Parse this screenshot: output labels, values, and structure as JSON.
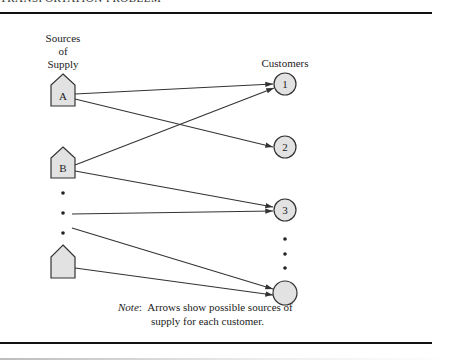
{
  "header": {
    "partial_title": "TRANSPORTATION PROBLEM"
  },
  "diagram": {
    "sources_title_lines": [
      "Sources",
      "of",
      "Supply"
    ],
    "customers_title": "Customers",
    "colors": {
      "node_fill": "#e2e2e2",
      "node_stroke": "#333333",
      "arrow": "#333333",
      "rule": "#111111"
    },
    "sources": [
      {
        "id": "A",
        "label": "A",
        "cx": 63,
        "top": 74,
        "shoulder": 85,
        "base": 106
      },
      {
        "id": "B",
        "label": "B",
        "cx": 63,
        "top": 147,
        "shoulder": 158,
        "base": 178
      },
      {
        "id": "N",
        "label": "",
        "cx": 63,
        "top": 245,
        "shoulder": 257,
        "base": 278
      }
    ],
    "source_ellipsis_dots": [
      {
        "x": 63,
        "y": 193
      },
      {
        "x": 63,
        "y": 213
      },
      {
        "x": 63,
        "y": 233
      }
    ],
    "customers": [
      {
        "id": "1",
        "label": "1",
        "cx": 285,
        "cy": 84,
        "r": 11
      },
      {
        "id": "2",
        "label": "2",
        "cx": 285,
        "cy": 147,
        "r": 11
      },
      {
        "id": "3",
        "label": "3",
        "cx": 285,
        "cy": 210,
        "r": 11
      },
      {
        "id": "N",
        "label": "",
        "cx": 285,
        "cy": 293,
        "r": 12
      }
    ],
    "customer_ellipsis_dots": [
      {
        "x": 285,
        "y": 239
      },
      {
        "x": 285,
        "y": 254
      },
      {
        "x": 285,
        "y": 268
      }
    ],
    "arrows": [
      {
        "from": "A",
        "to": "1",
        "x1": 75,
        "y1": 94,
        "x2": 273,
        "y2": 84
      },
      {
        "from": "A",
        "to": "2",
        "x1": 75,
        "y1": 99,
        "x2": 273,
        "y2": 147
      },
      {
        "from": "B",
        "to": "1",
        "x1": 75,
        "y1": 165,
        "x2": 274,
        "y2": 88
      },
      {
        "from": "B",
        "to": "3",
        "x1": 75,
        "y1": 171,
        "x2": 273,
        "y2": 207
      },
      {
        "from": "dots",
        "to": "3",
        "x1": 72,
        "y1": 214,
        "x2": 273,
        "y2": 211
      },
      {
        "from": "dots",
        "to": "N",
        "x1": 72,
        "y1": 228,
        "x2": 273,
        "y2": 289
      },
      {
        "from": "N",
        "to": "N",
        "x1": 75,
        "y1": 268,
        "x2": 273,
        "y2": 295
      }
    ]
  },
  "note": {
    "key": "Note",
    "line1": "Arrows show possible sources of",
    "line2": "supply for each customer."
  }
}
